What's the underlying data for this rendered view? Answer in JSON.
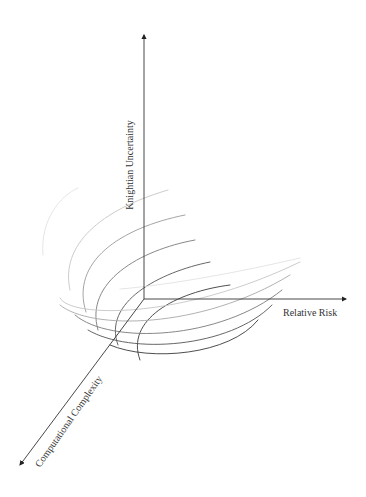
{
  "diagram": {
    "title": "",
    "origin": {
      "x": 144,
      "y": 299
    },
    "axes": [
      {
        "id": "knightian-uncertainty",
        "label": "Knightian Uncertainty",
        "direction": "up",
        "end": {
          "x": 144,
          "y": 35
        },
        "label_pos": {
          "x": 133,
          "y": 165
        },
        "label_rotation": -90
      },
      {
        "id": "relative-risk",
        "label": "Relative Risk",
        "direction": "right",
        "end": {
          "x": 346,
          "y": 299
        },
        "label_pos": {
          "x": 283,
          "y": 316
        },
        "label_rotation": 0
      },
      {
        "id": "computational-complexity",
        "label": "Computational Complexity",
        "direction": "down-left",
        "end": {
          "x": 20,
          "y": 465
        },
        "label_pos": {
          "x": 40,
          "y": 468
        },
        "label_rotation": -55
      }
    ],
    "colors": {
      "axis": "#333333",
      "curve_darkest": "#3a3a3a",
      "curve_dark": "#555555",
      "curve_mid": "#7a7a7a",
      "curve_light": "#a8a8a8",
      "curve_lightest": "#d6d6d6"
    },
    "vertical_curves": [
      {
        "d": "M 43 255 C 40 220, 60 196, 78 188",
        "color": "#e2e2e2"
      },
      {
        "d": "M 70 290 C 60 245, 100 210, 168 190",
        "color": "#c6c6c6"
      },
      {
        "d": "M 86 312 C 70 262, 120 228, 185 215",
        "color": "#9a9a9a"
      },
      {
        "d": "M 98 330 C 84 282, 140 250, 195 240",
        "color": "#7a7a7a"
      },
      {
        "d": "M 118 345 C 102 302, 160 272, 210 262",
        "color": "#555555"
      },
      {
        "d": "M 140 360 C 125 320, 175 292, 230 285",
        "color": "#3a3a3a"
      }
    ],
    "horizontal_curves": [
      {
        "d": "M 120 289 C 170 285, 240 272, 300 258",
        "color": "#e2e2e2"
      },
      {
        "d": "M 60 298 C 70 318, 180 320, 300 262",
        "color": "#c6c6c6"
      },
      {
        "d": "M 60 305 C 90 330, 200 330, 290 275",
        "color": "#a8a8a8"
      },
      {
        "d": "M 75 315 C 110 345, 220 340, 282 290",
        "color": "#7a7a7a"
      },
      {
        "d": "M 88 330 C 130 355, 230 348, 272 305",
        "color": "#555555"
      },
      {
        "d": "M 110 345 C 150 362, 230 355, 258 320",
        "color": "#3a3a3a"
      }
    ]
  }
}
